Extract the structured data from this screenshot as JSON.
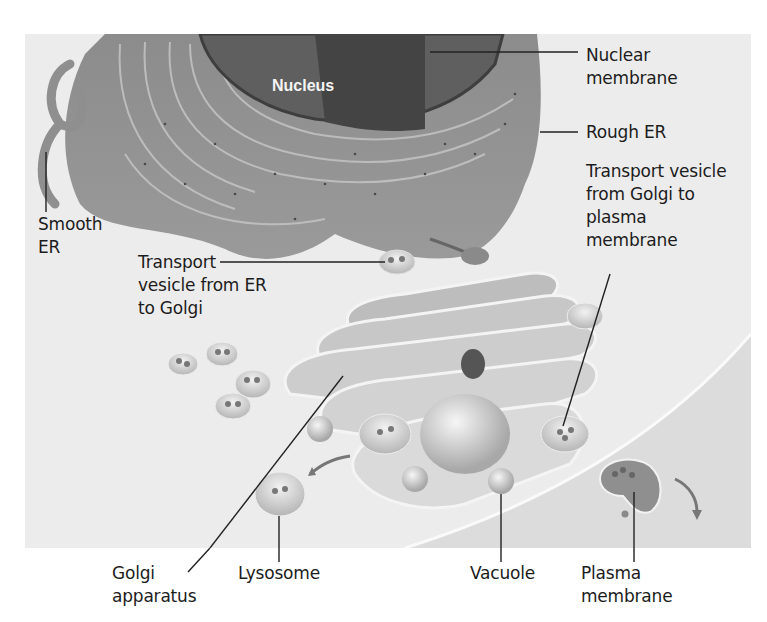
{
  "figure": {
    "type": "labeled biological illustration",
    "colors": {
      "background": "#ececec",
      "organelle_fill": "#8a8a8a",
      "nucleus_fill": "#5a5a5a",
      "label_text": "#1c1c1c",
      "nucleus_label": "#f4f4f4"
    }
  },
  "labels": {
    "nucleus": "Nucleus",
    "nuclear_membrane": [
      "Nuclear",
      "membrane"
    ],
    "rough_er": "Rough ER",
    "vesicle_golgi_to_pm": [
      "Transport vesicle",
      "from Golgi to",
      "plasma",
      "membrane"
    ],
    "smooth_er": [
      "Smooth",
      "ER"
    ],
    "vesicle_er_to_golgi": [
      "Transport",
      "vesicle from ER",
      "to Golgi"
    ],
    "golgi": [
      "Golgi",
      "apparatus"
    ],
    "lysosome": "Lysosome",
    "vacuole": "Vacuole",
    "plasma_membrane": [
      "Plasma",
      "membrane"
    ]
  }
}
